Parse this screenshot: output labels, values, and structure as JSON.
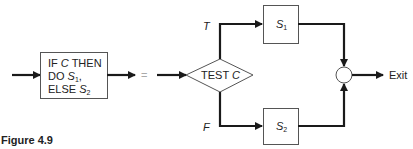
{
  "diagram": {
    "if_box": {
      "line1": "IF C THEN",
      "line1_prefix": "IF ",
      "line1_var": "C",
      "line1_suffix": " THEN",
      "line2_prefix": "DO ",
      "line2_var": "S",
      "line2_sub": "1",
      "line2_suffix": ",",
      "line3_prefix": "ELSE ",
      "line3_var": "S",
      "line3_sub": "2"
    },
    "equals": "=",
    "decision": {
      "prefix": "TEST ",
      "var": "C"
    },
    "branch_true": "T",
    "branch_false": "F",
    "s1": {
      "var": "S",
      "sub": "1"
    },
    "s2": {
      "var": "S",
      "sub": "2"
    },
    "exit_label": "Exit"
  },
  "caption": "Figure 4.9",
  "colors": {
    "line": "#1a1a1a",
    "box_stroke": "#555555",
    "text": "#222222"
  }
}
